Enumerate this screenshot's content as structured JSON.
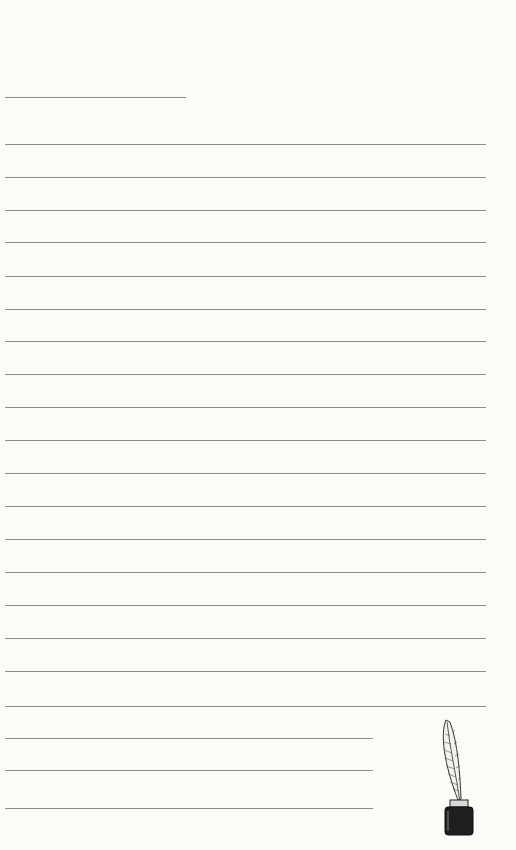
{
  "page": {
    "type": "lined writing paper",
    "background": "#fbfbfa",
    "line_color": "#8d8d8b"
  },
  "header_line": {
    "top": 97,
    "left": 5,
    "width": 181
  },
  "full_lines": [
    144,
    177,
    210,
    242,
    276,
    309,
    341,
    374,
    407,
    440,
    473,
    506,
    539,
    572,
    605,
    638,
    671,
    706
  ],
  "full_line_span": {
    "left": 5,
    "width": 481
  },
  "short_lines": [
    738,
    770,
    808
  ],
  "short_line_span": {
    "left": 5,
    "width": 368
  },
  "decoration": {
    "icon": "quill-inkwell-icon",
    "ink_color": "#1e1e1e"
  }
}
